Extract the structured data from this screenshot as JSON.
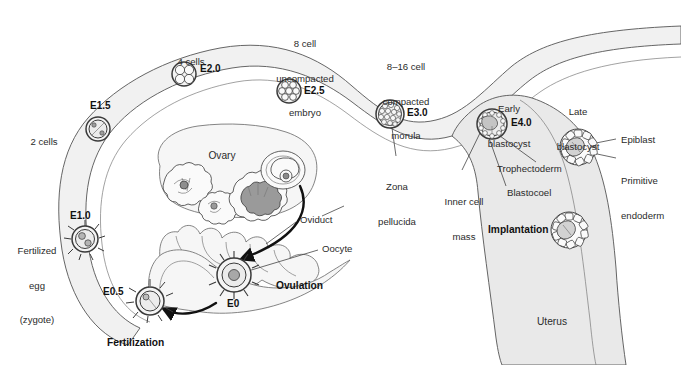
{
  "figure": {
    "type": "biological-diagram"
  },
  "colors": {
    "ink": "#2b2b2b",
    "stroke": "#4a4a4a",
    "tissue_fill": "#f1f1f1",
    "tissue_fill_dark": "#e4e4e4",
    "cell_fill": "#f3f3f3",
    "cell_dark": "#8d8d8d",
    "background": "#ffffff"
  },
  "stage_labels": [
    {
      "id": "e0",
      "text": "E0",
      "x": 227,
      "y": 305
    },
    {
      "id": "e05",
      "text": "E0.5",
      "x": 116,
      "y": 293
    },
    {
      "id": "e10",
      "text": "E1.0",
      "x": 70,
      "y": 216
    },
    {
      "id": "e15",
      "text": "E1.5",
      "x": 90,
      "y": 106
    },
    {
      "id": "e20",
      "text": "E2.0",
      "x": 201,
      "y": 68
    },
    {
      "id": "e25",
      "text": "E2.5",
      "x": 305,
      "y": 90
    },
    {
      "id": "e30",
      "text": "E3.0",
      "x": 409,
      "y": 112
    },
    {
      "id": "e40",
      "text": "E4.0",
      "x": 513,
      "y": 122
    }
  ],
  "descriptive_labels": [
    {
      "id": "two-cells",
      "lines": [
        "2 cells"
      ],
      "x": 44,
      "y": 119,
      "align": "center"
    },
    {
      "id": "four-cells",
      "lines": [
        "4 cells"
      ],
      "x": 191,
      "y": 39,
      "align": "center"
    },
    {
      "id": "eight-cell-embryo",
      "lines": [
        "8 cell",
        "uncompacted",
        "embryo"
      ],
      "x": 305,
      "y": 20,
      "align": "center"
    },
    {
      "id": "compacted-morula",
      "lines": [
        "8–16 cell",
        "compacted",
        "morula"
      ],
      "x": 406,
      "y": 43,
      "align": "center"
    },
    {
      "id": "early-blastocyst",
      "lines": [
        "Early",
        "blastocyst"
      ],
      "x": 509,
      "y": 84,
      "align": "center"
    },
    {
      "id": "late-blastocyst",
      "lines": [
        "Late",
        "blastocyst"
      ],
      "x": 578,
      "y": 87,
      "align": "center"
    },
    {
      "id": "zona-pellucida",
      "lines": [
        "Zona",
        "pellucida"
      ],
      "x": 397,
      "y": 163,
      "align": "center"
    },
    {
      "id": "inner-cell-mass",
      "lines": [
        "Inner cell",
        "mass",
        ""
      ],
      "x": 460,
      "y": 178,
      "align": "center"
    },
    {
      "id": "blastocoel",
      "lines": [
        "Blastocoel"
      ],
      "x": 515,
      "y": 192,
      "align": "left"
    },
    {
      "id": "trophectoderm",
      "lines": [
        "Trophectoderm"
      ],
      "x": 503,
      "y": 168,
      "align": "left"
    },
    {
      "id": "epiblast",
      "lines": [
        "Epiblast"
      ],
      "x": 621,
      "y": 140,
      "align": "left"
    },
    {
      "id": "primitive-endoderm",
      "lines": [
        "Primitive",
        "endoderm"
      ],
      "x": 621,
      "y": 162,
      "align": "left"
    },
    {
      "id": "ovary",
      "lines": [
        "Ovary"
      ],
      "x": 222,
      "y": 155,
      "align": "center"
    },
    {
      "id": "oviduct",
      "lines": [
        "Oviduct"
      ],
      "x": 300,
      "y": 219,
      "align": "left"
    },
    {
      "id": "oocyte",
      "lines": [
        "Oocyte"
      ],
      "x": 322,
      "y": 248,
      "align": "left"
    },
    {
      "id": "uterus",
      "lines": [
        "Uterus"
      ],
      "x": 552,
      "y": 321,
      "align": "center"
    },
    {
      "id": "fertilized-egg",
      "lines": [
        "Fertilized",
        "egg",
        "(zygote)"
      ],
      "x": 37,
      "y": 228,
      "align": "center"
    }
  ],
  "emphasis_labels": [
    {
      "id": "ovulation",
      "text": "Ovulation",
      "x": 276,
      "y": 285
    },
    {
      "id": "fertilization",
      "text": "Fertilization",
      "x": 107,
      "y": 343
    },
    {
      "id": "implantation",
      "text": "Implantation",
      "x": 492,
      "y": 229
    }
  ],
  "embryos": [
    {
      "id": "oocyte-e0",
      "stage": "E0",
      "cx": 234,
      "cy": 275,
      "r": 17,
      "kind": "oocyte"
    },
    {
      "id": "fertilized-e05",
      "stage": "E0.5",
      "cx": 150,
      "cy": 301,
      "r": 15,
      "kind": "zygote-pronuclei"
    },
    {
      "id": "zygote-e10",
      "stage": "E1.0",
      "cx": 85,
      "cy": 239,
      "r": 13,
      "kind": "zygote"
    },
    {
      "id": "two-cell-e15",
      "stage": "E1.5",
      "cx": 98,
      "cy": 129,
      "r": 12,
      "kind": "two-cell"
    },
    {
      "id": "four-cell-e20",
      "stage": "E2.0",
      "cx": 184,
      "cy": 74,
      "r": 12,
      "kind": "four-cell"
    },
    {
      "id": "eight-cell-e25",
      "stage": "E2.5",
      "cx": 289,
      "cy": 91,
      "r": 12,
      "kind": "eight-cell"
    },
    {
      "id": "morula-e30",
      "stage": "E3.0",
      "cx": 390,
      "cy": 114,
      "r": 14,
      "kind": "morula"
    },
    {
      "id": "early-blastocyst-e40",
      "stage": "E4.0",
      "cx": 492,
      "cy": 124,
      "r": 15,
      "kind": "blastocyst"
    },
    {
      "id": "late-blastocyst",
      "stage": "",
      "cx": 578,
      "cy": 147,
      "r": 18,
      "kind": "late-blastocyst"
    },
    {
      "id": "implanting-blastocyst",
      "stage": "",
      "cx": 569,
      "cy": 230,
      "r": 18,
      "kind": "late-blastocyst"
    }
  ],
  "follicles": [
    {
      "id": "primary-follicle",
      "cx": 179,
      "cy": 182,
      "r": 18
    },
    {
      "id": "secondary-follicle",
      "cx": 212,
      "cy": 204,
      "r": 14
    },
    {
      "id": "mature-follicle",
      "cx": 250,
      "cy": 196,
      "r": 18
    },
    {
      "id": "corpus-luteum",
      "cx": 283,
      "cy": 172,
      "r": 20
    }
  ],
  "arrows": [
    {
      "id": "ovulation-arrow",
      "from": "ovary",
      "to": "oviduct-infundibulum"
    },
    {
      "id": "fertilization-arrow",
      "from": "oocyte-e0",
      "to": "fertilized-e05"
    }
  ]
}
